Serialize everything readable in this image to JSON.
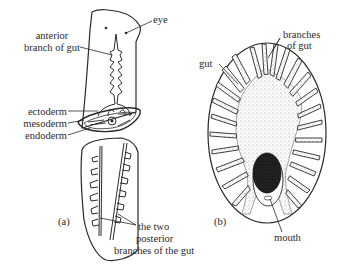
{
  "figure": {
    "panel_a": {
      "caption": "(a)",
      "labels": {
        "eye": "eye",
        "anterior_line1": "anterior",
        "anterior_line2": "branch of gut",
        "ectoderm": "ectoderm",
        "mesoderm": "mesoderm",
        "endoderm": "endoderm",
        "posterior_line1": "the two",
        "posterior_line2": "posterior",
        "posterior_line3": "branches of the gut"
      }
    },
    "panel_b": {
      "caption": "(b)",
      "labels": {
        "gut": "gut",
        "branches_line1": "branches",
        "branches_line2": "of gut",
        "mouth": "mouth"
      }
    },
    "colors": {
      "ink": "#2a2a2a",
      "background": "#ffffff",
      "pharynx": "#1c1c1c",
      "stipple": "#9a9a9a"
    }
  }
}
